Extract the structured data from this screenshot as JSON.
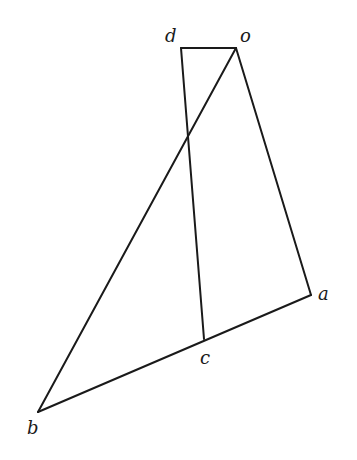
{
  "diagram": {
    "type": "geometric-vector-diagram",
    "points": {
      "o": {
        "label": "o",
        "x": 236,
        "y": 48
      },
      "d": {
        "label": "d",
        "x": 181,
        "y": 48
      },
      "a": {
        "label": "a",
        "x": 311,
        "y": 295
      },
      "c": {
        "label": "c",
        "x": 204,
        "y": 339
      },
      "b": {
        "label": "b",
        "x": 38,
        "y": 412
      }
    },
    "segments": [
      {
        "from": "d",
        "to": "o"
      },
      {
        "from": "o",
        "to": "a"
      },
      {
        "from": "a",
        "to": "b"
      },
      {
        "from": "b",
        "to": "o"
      },
      {
        "from": "d",
        "to": "c"
      }
    ],
    "labels": {
      "d": "d",
      "o": "o",
      "a": "a",
      "c": "c",
      "b": "b"
    }
  }
}
